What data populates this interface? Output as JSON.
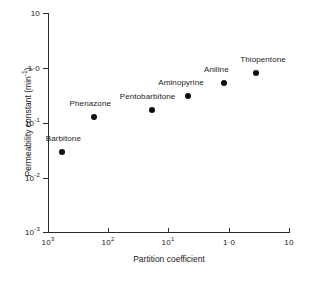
{
  "chart_data": {
    "type": "scatter",
    "title": "",
    "xlabel": "Partition coefficient",
    "ylabel": "Permeability constant (min⁻¹)",
    "ylabel_main": "Permeability constant (min",
    "ylabel_sup": "-1",
    "ylabel_tail": ")",
    "grid": false,
    "legend": "none",
    "x_scale": "log",
    "y_scale": "log",
    "x_axis_reversed": true,
    "xlim": [
      1000,
      10
    ],
    "ylim": [
      0.001,
      10
    ],
    "x_ticks": [
      {
        "value": 1000,
        "base": "10",
        "exp": "3"
      },
      {
        "value": 100,
        "base": "10",
        "exp": "2"
      },
      {
        "value": 10,
        "base": "10",
        "exp": "1"
      },
      {
        "value": 1,
        "base": "1·0",
        "exp": ""
      },
      {
        "value": 0.1,
        "base": "10",
        "exp": ""
      }
    ],
    "y_ticks": [
      {
        "value": 10,
        "base": "10",
        "exp": ""
      },
      {
        "value": 1,
        "base": "1·0",
        "exp": ""
      },
      {
        "value": 0.1,
        "base": "10",
        "exp": "-1"
      },
      {
        "value": 0.01,
        "base": "10",
        "exp": "-2"
      },
      {
        "value": 0.001,
        "base": "10",
        "exp": "-3"
      }
    ],
    "marker_color": "#0d0d0d",
    "axis_color": "#2b2b2b",
    "points": [
      {
        "name": "Barbitone",
        "x": 590,
        "y": 0.029,
        "label": "Barbitone"
      },
      {
        "name": "Phenazone",
        "x": 175,
        "y": 0.125,
        "label": "Phenazone"
      },
      {
        "name": "Pentobarbitone",
        "x": 19,
        "y": 0.17,
        "label": "Pentobarbitone"
      },
      {
        "name": "Aminopyrine",
        "x": 4.7,
        "y": 0.3,
        "label": "Aminopyrine"
      },
      {
        "name": "Aniline",
        "x": 1.2,
        "y": 0.52,
        "label": "Aniline"
      },
      {
        "name": "Thiopentone",
        "x": 0.35,
        "y": 0.79,
        "label": "Thiopentone"
      }
    ]
  }
}
